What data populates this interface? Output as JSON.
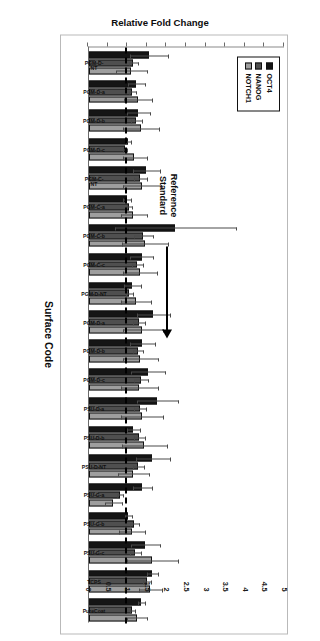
{
  "chart_data": {
    "type": "bar",
    "title": "",
    "xlabel": "Surface Code",
    "ylabel": "Relative Fold Change",
    "ylim": [
      0,
      5
    ],
    "yticks": [
      "0",
      "0.5",
      "1",
      "1.5",
      "2",
      "2.5",
      "3",
      "3.5",
      "4",
      "4.5",
      "5"
    ],
    "grid": false,
    "legend_position": "top-left",
    "reference_line": {
      "value": 1,
      "style": "dashed",
      "label": "Reference\nStandard"
    },
    "categories": [
      "PGM-D-\nNT",
      "PGM-D-a",
      "PGM-D-b",
      "PGM-D-c",
      "PGM-C-\nNT",
      "PGM-C-a",
      "PGM-C-b",
      "PGM-C-c",
      "PGM-D-NT",
      "PGM-D-a",
      "PGM-D-b",
      "PGM-D-c",
      "PSU-D-a",
      "PSU-D-b",
      "PSU-D-NT",
      "PSU-G-a",
      "PSU-G-b",
      "PSU-G-c",
      "TCPS",
      "PureCoat"
    ],
    "series": [
      {
        "name": "OCT4",
        "color": "#151515",
        "values": [
          1.52,
          1.2,
          1.26,
          1.0,
          1.46,
          0.96,
          2.2,
          1.34,
          1.1,
          1.64,
          1.36,
          1.5,
          1.74,
          1.12,
          1.62,
          1.36,
          0.99,
          1.44,
          1.61,
          1.33
        ],
        "errors": [
          0.5,
          0.22,
          0.3,
          0.08,
          0.36,
          0.1,
          1.55,
          0.3,
          0.22,
          0.42,
          0.32,
          0.44,
          0.52,
          0.18,
          0.44,
          0.26,
          0.1,
          0.38,
          0.14,
          0.1
        ]
      },
      {
        "name": "NANOG",
        "color": "#4f4f4f",
        "values": [
          1.13,
          1.11,
          1.2,
          0.91,
          1.3,
          1.02,
          1.38,
          1.22,
          1.02,
          1.27,
          1.24,
          1.32,
          1.29,
          1.28,
          1.26,
          0.78,
          1.16,
          1.18,
          1.48,
          1.1
        ],
        "errors": [
          0.12,
          0.1,
          0.14,
          0.07,
          0.18,
          0.09,
          0.26,
          0.15,
          0.1,
          0.16,
          0.14,
          0.18,
          0.17,
          0.16,
          0.15,
          0.08,
          0.12,
          0.14,
          0.11,
          0.08
        ]
      },
      {
        "name": "NOTCH1",
        "color": "#9e9e9e",
        "values": [
          1.08,
          1.24,
          1.32,
          1.16,
          1.35,
          1.13,
          1.42,
          1.3,
          1.19,
          1.36,
          1.3,
          1.28,
          1.34,
          1.41,
          1.12,
          0.62,
          1.09,
          1.6,
          1.55,
          1.22
        ],
        "errors": [
          0.4,
          0.36,
          0.46,
          0.32,
          0.5,
          0.34,
          0.6,
          0.44,
          0.38,
          0.52,
          0.46,
          0.48,
          0.54,
          0.58,
          0.4,
          0.22,
          0.34,
          0.66,
          0.3,
          0.26
        ]
      }
    ]
  },
  "legend": {
    "items": [
      {
        "label": "OCT4"
      },
      {
        "label": "NANOG"
      },
      {
        "label": "NOTCH1"
      }
    ]
  },
  "annotation": {
    "reference_standard": "Reference\nStandard"
  }
}
